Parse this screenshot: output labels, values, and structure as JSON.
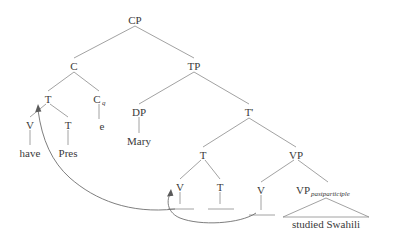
{
  "diagram": {
    "type": "syntax-tree",
    "background_color": "#ffffff",
    "line_color": "#8a8a8a",
    "text_color": "#3a3a3a",
    "nodes": [
      {
        "id": "CP",
        "label": "CP",
        "x": 135,
        "y": 20
      },
      {
        "id": "C",
        "label": "C",
        "x": 74,
        "y": 66
      },
      {
        "id": "TP",
        "label": "TP",
        "x": 194,
        "y": 66
      },
      {
        "id": "T1",
        "label": "T",
        "x": 48,
        "y": 99
      },
      {
        "id": "Cq",
        "label": "C",
        "x": 99,
        "y": 99,
        "subscript": "q"
      },
      {
        "id": "DP",
        "label": "DP",
        "x": 139,
        "y": 112
      },
      {
        "id": "Tbar",
        "label": "T'",
        "x": 249,
        "y": 112
      },
      {
        "id": "V1",
        "label": "V",
        "x": 30,
        "y": 125
      },
      {
        "id": "T2",
        "label": "T",
        "x": 68,
        "y": 125
      },
      {
        "id": "e",
        "label": "e",
        "x": 102,
        "y": 126
      },
      {
        "id": "Mary",
        "label": "Mary",
        "x": 139,
        "y": 141
      },
      {
        "id": "have",
        "label": "have",
        "x": 30,
        "y": 153
      },
      {
        "id": "Pres",
        "label": "Pres",
        "x": 68,
        "y": 153
      },
      {
        "id": "T3",
        "label": "T",
        "x": 203,
        "y": 155
      },
      {
        "id": "VP",
        "label": "VP",
        "x": 296,
        "y": 155
      },
      {
        "id": "V2",
        "label": "V",
        "x": 180,
        "y": 187
      },
      {
        "id": "T4",
        "label": "T",
        "x": 220,
        "y": 187
      },
      {
        "id": "V3",
        "label": "V",
        "x": 261,
        "y": 190
      },
      {
        "id": "VPpp",
        "label": "VP",
        "x": 305,
        "y": 190,
        "subscript": "pastparticiple"
      }
    ],
    "leaves": [
      {
        "id": "studied-swahili",
        "label": "studied Swahili",
        "x": 326,
        "y": 225
      }
    ],
    "traces": [
      {
        "id": "trace-v2",
        "x": 180,
        "y": 208
      },
      {
        "id": "trace-t4",
        "x": 220,
        "y": 208
      },
      {
        "id": "trace-v3",
        "x": 261,
        "y": 214
      }
    ],
    "movement_arrows": [
      {
        "id": "arrow-v-to-t",
        "from": "V2",
        "to": "T1",
        "description": "head movement of V to T"
      },
      {
        "id": "arrow-v-to-v",
        "from": "V3",
        "to": "V2",
        "description": "head movement of lower V to upper V"
      }
    ],
    "subscripts": {
      "cq": "q",
      "vp": "pastparticiple"
    }
  }
}
